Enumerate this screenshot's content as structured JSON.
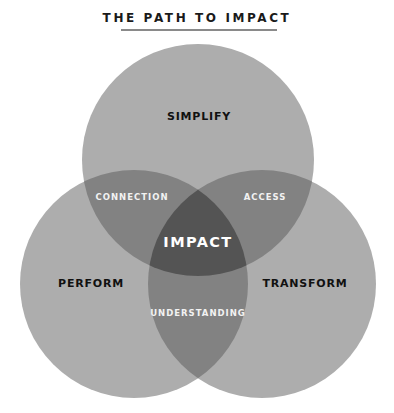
{
  "title": "THE PATH TO IMPACT",
  "colors": {
    "single": "#adadad",
    "double": "#828282",
    "triple": "#545454",
    "outer_label": "#111111",
    "inner_label": "#f2f2f2",
    "title_rule": "#8a8a8a"
  },
  "sets": [
    {
      "id": "top",
      "label": "SIMPLIFY"
    },
    {
      "id": "left",
      "label": "PERFORM"
    },
    {
      "id": "right",
      "label": "TRANSFORM"
    }
  ],
  "intersections": [
    {
      "sets": [
        "top",
        "left"
      ],
      "label": "CONNECTION"
    },
    {
      "sets": [
        "top",
        "right"
      ],
      "label": "ACCESS"
    },
    {
      "sets": [
        "left",
        "right"
      ],
      "label": "UNDERSTANDING"
    },
    {
      "sets": [
        "top",
        "left",
        "right"
      ],
      "label": "IMPACT"
    }
  ]
}
